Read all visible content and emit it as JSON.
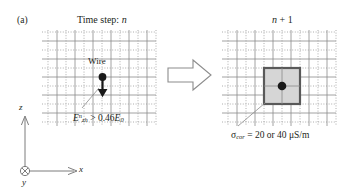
{
  "figure": {
    "panel_label": "(a)",
    "type": "fdtd-yee-grid-corona-diagram"
  },
  "left_panel": {
    "header_prefix": "Time step: ",
    "header_symbol": "n",
    "wire_label": "Wire",
    "threshold": {
      "base": "E",
      "superscript": "n",
      "subscript": "zh",
      "relation": " > 0.46",
      "reference_base": "E",
      "reference_subscript": "0",
      "full_text": "E^n_zh > 0.46 E_0"
    },
    "grid": {
      "solid_color": "#8a8a8a",
      "dotted_color": "#9a9a9a",
      "columns": 6,
      "rows": 5,
      "cell_size": 18
    }
  },
  "transition": {
    "arrow_name": "block-arrow-right",
    "arrow_stroke": "#8c8c8c"
  },
  "right_panel": {
    "header_symbol": "n",
    "header_suffix": " + 1",
    "header_text": "n + 1",
    "conductivity": {
      "symbol": "σ",
      "subscript": "cor",
      "relation": " = 20 or 40 μS/m",
      "values": [
        20,
        40
      ],
      "unit": "μS/m",
      "full_text": "σcor = 20 or 40 μS/m"
    },
    "highlighted_cell": {
      "fill": "#d6d6d6",
      "stroke": "#595959",
      "node_color": "#1a1a1a"
    },
    "grid": {
      "solid_color": "#8a8a8a",
      "dotted_color": "#9a9a9a",
      "columns": 6,
      "rows": 5,
      "cell_size": 18
    }
  },
  "axes": {
    "z_label": "z",
    "x_label": "x",
    "y_label": "y",
    "y_marker": "into-page-circle-x",
    "color": "#6e6e6e"
  },
  "colors": {
    "text": "#231f20",
    "grid_solid": "#8a8a8a",
    "grid_dotted": "#9a9a9a",
    "cell_fill": "#d6d6d6",
    "cell_stroke": "#595959",
    "leader": "#8c8c8c"
  }
}
